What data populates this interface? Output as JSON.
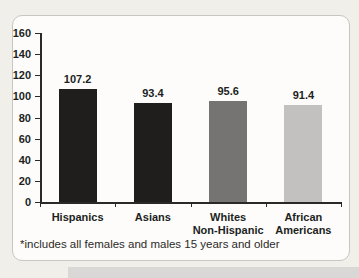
{
  "page": {
    "background_color": "#f1efea",
    "bottom_band_color": "#d9d8d6"
  },
  "card": {
    "background_color": "#fdfcfa",
    "border_color": "#c7c6c2"
  },
  "chart_data": {
    "type": "bar",
    "title": "",
    "categories": [
      "Hispanics",
      "Asians",
      "Whites\nNon-Hispanic",
      "African\nAmericans"
    ],
    "values": [
      107.2,
      93.4,
      95.6,
      91.4
    ],
    "value_labels": [
      "107.2",
      "93.4",
      "95.6",
      "91.4"
    ],
    "bar_colors": [
      "#201d1d",
      "#201d1d",
      "#757473",
      "#c2c1c0"
    ],
    "xlabel": "",
    "ylabel": "",
    "ylim": [
      0,
      160
    ],
    "yticks": [
      0,
      20,
      40,
      60,
      80,
      100,
      120,
      140,
      160
    ],
    "grid": false,
    "legend": null,
    "axis_color": "#2a2927",
    "text_color": "#211f1e",
    "footnote": "*includes all females and males 15 years and older"
  }
}
